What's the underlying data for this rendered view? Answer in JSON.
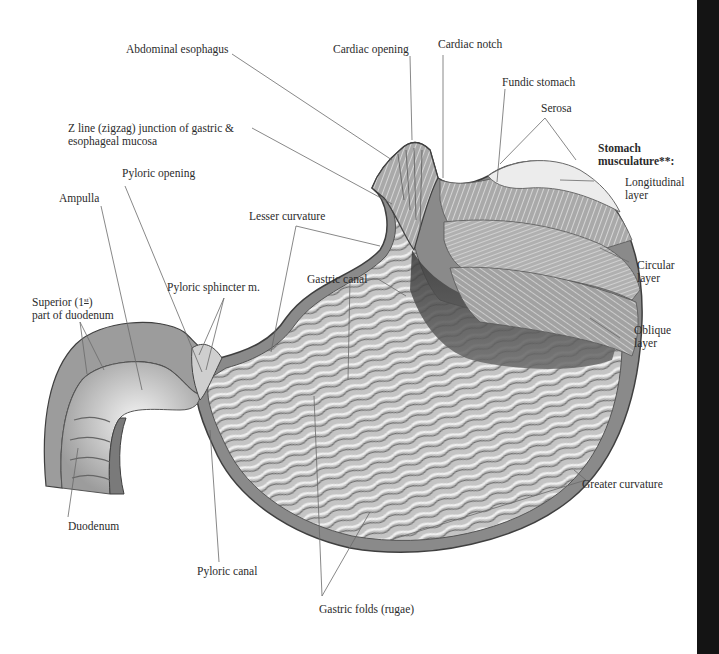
{
  "figure": {
    "colors": {
      "background": "#ffffff",
      "right_bar": "#141414",
      "label_text": "#2b2b2b",
      "leader_line": "#6a6a6a",
      "tissue_light": "#e6e6e6",
      "tissue_mid": "#b4b4b4",
      "tissue_dark": "#4a4a4a"
    }
  },
  "labels": {
    "abdominal_esophagus": "Abdominal esophagus",
    "cardiac_opening": "Cardiac opening",
    "cardiac_notch": "Cardiac notch",
    "fundic_stomach": "Fundic stomach",
    "serosa": "Serosa",
    "z_line_1": "Z line (zigzag) junction of gastric &",
    "z_line_2": "esophageal mucosa",
    "pyloric_opening": "Pyloric opening",
    "ampulla": "Ampulla",
    "lesser_curvature": "Lesser curvature",
    "stomach_musculature_1": "Stomach",
    "stomach_musculature_2": "musculature**:",
    "longitudinal_layer_1": "Longitudinal",
    "longitudinal_layer_2": "layer",
    "circular_layer_1": "Circular",
    "circular_layer_2": "layer",
    "oblique_layer_1": "Oblique",
    "oblique_layer_2": "layer",
    "superior_duodenum_1a": "Superior (1",
    "superior_duodenum_1sup": "st",
    "superior_duodenum_1b": ")",
    "superior_duodenum_2": "part of duodenum",
    "pyloric_sphincter": "Pyloric sphincter m.",
    "gastric_canal": "Gastric canal",
    "greater_curvature": "Greater curvature",
    "duodenum": "Duodenum",
    "pyloric_canal": "Pyloric canal",
    "gastric_folds": "Gastric folds (rugae)"
  }
}
